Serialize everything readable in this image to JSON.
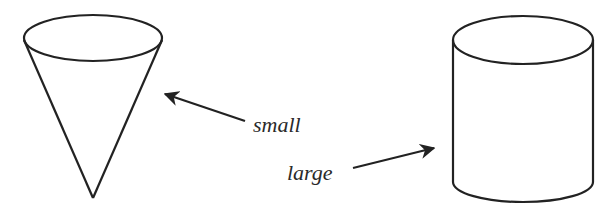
{
  "diagram": {
    "shapes": [
      {
        "id": "cone",
        "type": "cone",
        "label": "small"
      },
      {
        "id": "cylinder",
        "type": "cylinder",
        "label": "large"
      }
    ],
    "labels": {
      "small": "small",
      "large": "large"
    },
    "stroke_color": "#222222"
  }
}
